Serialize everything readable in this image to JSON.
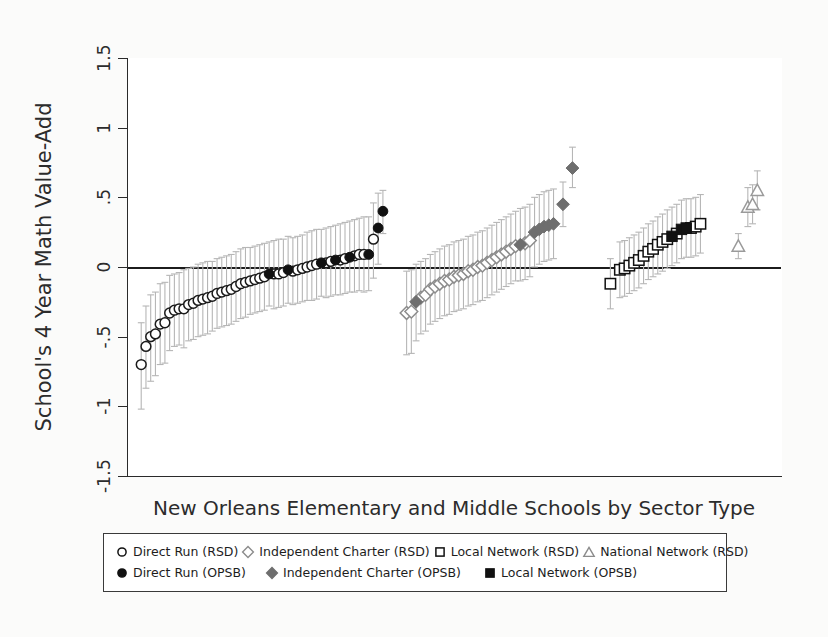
{
  "chart_data": {
    "type": "scatter",
    "title": "",
    "xlabel": "New Orleans Elementary and Middle Schools by Sector Type",
    "ylabel": "School's 4 Year Math Value-Add",
    "ylim": [
      -1.5,
      1.5
    ],
    "yticks": [
      "-1.5",
      "-1",
      "-.5",
      "0",
      ".5",
      "1",
      "1.5"
    ],
    "ytick_values": [
      -1.5,
      -1,
      -0.5,
      0,
      0.5,
      1,
      1.5
    ],
    "xticks": [],
    "grid": false,
    "zero_reference_line": 0,
    "legend_position": "below-axis",
    "error_bars": "95% confidence interval (vertical whiskers, light gray)",
    "series": [
      {
        "name": "Direct Run (RSD)",
        "marker": "circle-open",
        "color": "#1a1a1a",
        "fill": "#ffffff",
        "points": [
          {
            "x": 1,
            "y": -0.7,
            "lo": -1.02,
            "hi": -0.4
          },
          {
            "x": 2,
            "y": -0.57,
            "lo": -0.87,
            "hi": -0.28
          },
          {
            "x": 3,
            "y": -0.5,
            "lo": -0.82,
            "hi": -0.2
          },
          {
            "x": 4,
            "y": -0.48,
            "lo": -0.78,
            "hi": -0.18
          },
          {
            "x": 5,
            "y": -0.41,
            "lo": -0.7,
            "hi": -0.12
          },
          {
            "x": 6,
            "y": -0.4,
            "lo": -0.69,
            "hi": -0.11
          },
          {
            "x": 7,
            "y": -0.33,
            "lo": -0.6,
            "hi": -0.06
          },
          {
            "x": 8,
            "y": -0.31,
            "lo": -0.57,
            "hi": -0.05
          },
          {
            "x": 9,
            "y": -0.3,
            "lo": -0.56,
            "hi": -0.04
          },
          {
            "x": 10,
            "y": -0.3,
            "lo": -0.58,
            "hi": -0.02
          },
          {
            "x": 11,
            "y": -0.27,
            "lo": -0.53,
            "hi": -0.01
          },
          {
            "x": 12,
            "y": -0.26,
            "lo": -0.52,
            "hi": 0.0
          },
          {
            "x": 13,
            "y": -0.24,
            "lo": -0.5,
            "hi": 0.02
          },
          {
            "x": 14,
            "y": -0.23,
            "lo": -0.49,
            "hi": 0.03
          },
          {
            "x": 15,
            "y": -0.22,
            "lo": -0.48,
            "hi": 0.04
          },
          {
            "x": 16,
            "y": -0.21,
            "lo": -0.46,
            "hi": 0.04
          },
          {
            "x": 17,
            "y": -0.19,
            "lo": -0.44,
            "hi": 0.06
          },
          {
            "x": 18,
            "y": -0.18,
            "lo": -0.43,
            "hi": 0.07
          },
          {
            "x": 19,
            "y": -0.17,
            "lo": -0.42,
            "hi": 0.08
          },
          {
            "x": 20,
            "y": -0.16,
            "lo": -0.41,
            "hi": 0.09
          },
          {
            "x": 21,
            "y": -0.14,
            "lo": -0.39,
            "hi": 0.11
          },
          {
            "x": 22,
            "y": -0.12,
            "lo": -0.37,
            "hi": 0.13
          },
          {
            "x": 23,
            "y": -0.11,
            "lo": -0.36,
            "hi": 0.14
          },
          {
            "x": 24,
            "y": -0.1,
            "lo": -0.34,
            "hi": 0.14
          },
          {
            "x": 25,
            "y": -0.09,
            "lo": -0.33,
            "hi": 0.15
          },
          {
            "x": 26,
            "y": -0.08,
            "lo": -0.32,
            "hi": 0.16
          },
          {
            "x": 27,
            "y": -0.07,
            "lo": -0.31,
            "hi": 0.17
          },
          {
            "x": 29,
            "y": -0.05,
            "lo": -0.3,
            "hi": 0.19
          },
          {
            "x": 30,
            "y": -0.05,
            "lo": -0.29,
            "hi": 0.2
          },
          {
            "x": 31,
            "y": -0.04,
            "lo": -0.28,
            "hi": 0.2
          },
          {
            "x": 33,
            "y": -0.03,
            "lo": -0.27,
            "hi": 0.21
          },
          {
            "x": 34,
            "y": -0.02,
            "lo": -0.26,
            "hi": 0.22
          },
          {
            "x": 35,
            "y": -0.01,
            "lo": -0.25,
            "hi": 0.23
          },
          {
            "x": 36,
            "y": 0.0,
            "lo": -0.24,
            "hi": 0.25
          },
          {
            "x": 37,
            "y": 0.01,
            "lo": -0.24,
            "hi": 0.26
          },
          {
            "x": 38,
            "y": 0.02,
            "lo": -0.23,
            "hi": 0.27
          },
          {
            "x": 40,
            "y": 0.03,
            "lo": -0.22,
            "hi": 0.28
          },
          {
            "x": 41,
            "y": 0.04,
            "lo": -0.21,
            "hi": 0.29
          },
          {
            "x": 43,
            "y": 0.05,
            "lo": -0.2,
            "hi": 0.31
          },
          {
            "x": 44,
            "y": 0.06,
            "lo": -0.19,
            "hi": 0.32
          },
          {
            "x": 46,
            "y": 0.08,
            "lo": -0.18,
            "hi": 0.34
          },
          {
            "x": 47,
            "y": 0.09,
            "lo": -0.17,
            "hi": 0.35
          },
          {
            "x": 48,
            "y": 0.09,
            "lo": -0.18,
            "hi": 0.36
          },
          {
            "x": 50,
            "y": 0.2,
            "lo": -0.08,
            "hi": 0.46
          }
        ]
      },
      {
        "name": "Direct Run (OPSB)",
        "marker": "circle-filled",
        "color": "#111111",
        "fill": "#111111",
        "points": [
          {
            "x": 28,
            "y": -0.05,
            "lo": -0.28,
            "hi": 0.18
          },
          {
            "x": 32,
            "y": -0.02,
            "lo": -0.26,
            "hi": 0.22
          },
          {
            "x": 39,
            "y": 0.03,
            "lo": -0.21,
            "hi": 0.27
          },
          {
            "x": 42,
            "y": 0.05,
            "lo": -0.2,
            "hi": 0.3
          },
          {
            "x": 45,
            "y": 0.07,
            "lo": -0.18,
            "hi": 0.33
          },
          {
            "x": 49,
            "y": 0.09,
            "lo": -0.17,
            "hi": 0.36
          },
          {
            "x": 51,
            "y": 0.28,
            "lo": 0.02,
            "hi": 0.53
          },
          {
            "x": 52,
            "y": 0.4,
            "lo": 0.24,
            "hi": 0.55
          }
        ]
      },
      {
        "name": "Independent Charter (RSD)",
        "marker": "diamond-open",
        "color": "#8c8c8c",
        "fill": "#ffffff",
        "points": [
          {
            "x": 57,
            "y": -0.33,
            "lo": -0.63,
            "hi": -0.03
          },
          {
            "x": 58,
            "y": -0.32,
            "lo": -0.62,
            "hi": -0.02
          },
          {
            "x": 60,
            "y": -0.22,
            "lo": -0.48,
            "hi": 0.04
          },
          {
            "x": 61,
            "y": -0.2,
            "lo": -0.46,
            "hi": 0.06
          },
          {
            "x": 62,
            "y": -0.16,
            "lo": -0.41,
            "hi": 0.09
          },
          {
            "x": 63,
            "y": -0.14,
            "lo": -0.39,
            "hi": 0.11
          },
          {
            "x": 64,
            "y": -0.12,
            "lo": -0.37,
            "hi": 0.13
          },
          {
            "x": 65,
            "y": -0.1,
            "lo": -0.35,
            "hi": 0.15
          },
          {
            "x": 66,
            "y": -0.09,
            "lo": -0.34,
            "hi": 0.16
          },
          {
            "x": 67,
            "y": -0.07,
            "lo": -0.32,
            "hi": 0.18
          },
          {
            "x": 68,
            "y": -0.06,
            "lo": -0.31,
            "hi": 0.19
          },
          {
            "x": 69,
            "y": -0.05,
            "lo": -0.3,
            "hi": 0.2
          },
          {
            "x": 70,
            "y": -0.03,
            "lo": -0.28,
            "hi": 0.22
          },
          {
            "x": 71,
            "y": -0.02,
            "lo": -0.27,
            "hi": 0.23
          },
          {
            "x": 72,
            "y": 0.0,
            "lo": -0.25,
            "hi": 0.25
          },
          {
            "x": 73,
            "y": 0.01,
            "lo": -0.24,
            "hi": 0.26
          },
          {
            "x": 74,
            "y": 0.03,
            "lo": -0.22,
            "hi": 0.28
          },
          {
            "x": 75,
            "y": 0.05,
            "lo": -0.2,
            "hi": 0.3
          },
          {
            "x": 76,
            "y": 0.07,
            "lo": -0.18,
            "hi": 0.32
          },
          {
            "x": 77,
            "y": 0.09,
            "lo": -0.16,
            "hi": 0.34
          },
          {
            "x": 78,
            "y": 0.11,
            "lo": -0.14,
            "hi": 0.36
          },
          {
            "x": 79,
            "y": 0.13,
            "lo": -0.12,
            "hi": 0.38
          },
          {
            "x": 80,
            "y": 0.15,
            "lo": -0.1,
            "hi": 0.4
          },
          {
            "x": 82,
            "y": 0.17,
            "lo": -0.09,
            "hi": 0.43
          },
          {
            "x": 83,
            "y": 0.19,
            "lo": -0.07,
            "hi": 0.45
          }
        ]
      },
      {
        "name": "Independent Charter (OPSB)",
        "marker": "diamond-filled",
        "color": "#6e6e6e",
        "fill": "#6e6e6e",
        "points": [
          {
            "x": 59,
            "y": -0.25,
            "lo": -0.53,
            "hi": 0.02
          },
          {
            "x": 81,
            "y": 0.16,
            "lo": -0.1,
            "hi": 0.42
          },
          {
            "x": 84,
            "y": 0.25,
            "lo": 0.0,
            "hi": 0.5
          },
          {
            "x": 85,
            "y": 0.27,
            "lo": 0.02,
            "hi": 0.52
          },
          {
            "x": 86,
            "y": 0.29,
            "lo": 0.04,
            "hi": 0.54
          },
          {
            "x": 87,
            "y": 0.3,
            "lo": 0.05,
            "hi": 0.55
          },
          {
            "x": 88,
            "y": 0.31,
            "lo": 0.06,
            "hi": 0.56
          },
          {
            "x": 90,
            "y": 0.45,
            "lo": 0.29,
            "hi": 0.61
          },
          {
            "x": 92,
            "y": 0.71,
            "lo": 0.57,
            "hi": 0.86
          }
        ]
      },
      {
        "name": "Local Network (RSD)",
        "marker": "square-open",
        "color": "#101010",
        "fill": "#ffffff",
        "points": [
          {
            "x": 100,
            "y": -0.12,
            "lo": -0.3,
            "hi": 0.06
          },
          {
            "x": 102,
            "y": -0.02,
            "lo": -0.22,
            "hi": 0.18
          },
          {
            "x": 103,
            "y": -0.01,
            "lo": -0.21,
            "hi": 0.19
          },
          {
            "x": 104,
            "y": 0.01,
            "lo": -0.19,
            "hi": 0.21
          },
          {
            "x": 105,
            "y": 0.03,
            "lo": -0.17,
            "hi": 0.23
          },
          {
            "x": 106,
            "y": 0.05,
            "lo": -0.15,
            "hi": 0.25
          },
          {
            "x": 107,
            "y": 0.08,
            "lo": -0.12,
            "hi": 0.28
          },
          {
            "x": 108,
            "y": 0.11,
            "lo": -0.09,
            "hi": 0.31
          },
          {
            "x": 109,
            "y": 0.13,
            "lo": -0.07,
            "hi": 0.33
          },
          {
            "x": 110,
            "y": 0.16,
            "lo": -0.05,
            "hi": 0.36
          },
          {
            "x": 111,
            "y": 0.18,
            "lo": -0.03,
            "hi": 0.38
          },
          {
            "x": 112,
            "y": 0.2,
            "lo": -0.01,
            "hi": 0.41
          },
          {
            "x": 114,
            "y": 0.24,
            "lo": 0.03,
            "hi": 0.45
          },
          {
            "x": 117,
            "y": 0.28,
            "lo": 0.07,
            "hi": 0.49
          },
          {
            "x": 118,
            "y": 0.29,
            "lo": 0.08,
            "hi": 0.5
          },
          {
            "x": 119,
            "y": 0.31,
            "lo": 0.1,
            "hi": 0.52
          }
        ]
      },
      {
        "name": "Local Network (OPSB)",
        "marker": "square-filled",
        "color": "#111111",
        "fill": "#111111",
        "points": [
          {
            "x": 113,
            "y": 0.22,
            "lo": 0.01,
            "hi": 0.43
          },
          {
            "x": 115,
            "y": 0.27,
            "lo": 0.06,
            "hi": 0.48
          },
          {
            "x": 116,
            "y": 0.28,
            "lo": 0.07,
            "hi": 0.49
          }
        ]
      },
      {
        "name": "National Network (RSD)",
        "marker": "triangle-open",
        "color": "#9a9a9a",
        "fill": "#ffffff",
        "points": [
          {
            "x": 127,
            "y": 0.15,
            "lo": 0.06,
            "hi": 0.24
          },
          {
            "x": 129,
            "y": 0.43,
            "lo": 0.29,
            "hi": 0.57
          },
          {
            "x": 130,
            "y": 0.45,
            "lo": 0.31,
            "hi": 0.59
          },
          {
            "x": 131,
            "y": 0.55,
            "lo": 0.41,
            "hi": 0.69
          }
        ]
      }
    ]
  },
  "axis": {
    "ylabel": "School's 4 Year Math Value-Add",
    "xlabel": "New Orleans Elementary and Middle Schools by Sector Type",
    "ytick_labels": [
      "1.5",
      "1",
      ".5",
      "0",
      "-.5",
      "-1",
      "-1.5"
    ]
  },
  "legend": {
    "rows": [
      [
        {
          "symbol": "circle-open",
          "label": "Direct Run (RSD)"
        },
        {
          "symbol": "diamond-open",
          "label": "Independent Charter (RSD)"
        },
        {
          "symbol": "square-open",
          "label": "Local Network (RSD)"
        },
        {
          "symbol": "triangle-open",
          "label": "National Network (RSD)"
        }
      ],
      [
        {
          "symbol": "circle-filled",
          "label": "Direct Run (OPSB)"
        },
        {
          "symbol": "diamond-filled",
          "label": "Independent Charter (OPSB)"
        },
        {
          "symbol": "square-filled",
          "label": "Local Network (OPSB)"
        }
      ]
    ]
  },
  "colors": {
    "axis": "#2a2a2a",
    "zero_line": "#1c1c1c",
    "error_bar": "#b6b6b6",
    "rsd_gray": "#8c8c8c",
    "opsb_black": "#111111",
    "page_background": "#fbfbfa"
  }
}
